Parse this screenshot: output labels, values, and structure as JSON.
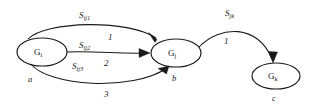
{
  "diagram": {
    "background_color": "#ffffff",
    "stroke_color": "#1a1a1a",
    "nodes": [
      {
        "id": "Gi",
        "label_base": "G",
        "label_sub": "i",
        "tag": "a",
        "cx": 42,
        "cy": 52,
        "rx": 25,
        "ry": 14
      },
      {
        "id": "Gj",
        "label_base": "G",
        "label_sub": "j",
        "tag": "b",
        "cx": 176,
        "cy": 53,
        "rx": 25,
        "ry": 14
      },
      {
        "id": "Gk",
        "label_base": "G",
        "label_sub": "k",
        "tag": "c",
        "cx": 276,
        "cy": 76,
        "rx": 24,
        "ry": 13
      }
    ],
    "edges": [
      {
        "id": "e1",
        "from": "Gi",
        "to": "Gj",
        "name_base": "S",
        "name_sub": "ij1",
        "weight": "1"
      },
      {
        "id": "e2",
        "from": "Gi",
        "to": "Gj",
        "name_base": "S",
        "name_sub": "ij2",
        "weight": "2"
      },
      {
        "id": "e3",
        "from": "Gi",
        "to": "Gj",
        "name_base": "S",
        "name_sub": "ij3",
        "weight": "3"
      },
      {
        "id": "e4",
        "from": "Gj",
        "to": "Gk",
        "name_base": "S",
        "name_sub": "jk",
        "weight": "1"
      }
    ]
  }
}
